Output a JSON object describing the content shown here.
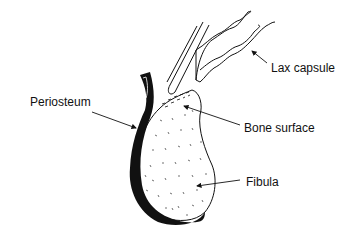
{
  "diagram": {
    "labels": {
      "lax_capsule": "Lax capsule",
      "periosteum": "Periosteum",
      "bone_surface": "Bone surface",
      "fibula": "Fibula"
    },
    "colors": {
      "ink": "#111111",
      "background": "#ffffff"
    }
  }
}
